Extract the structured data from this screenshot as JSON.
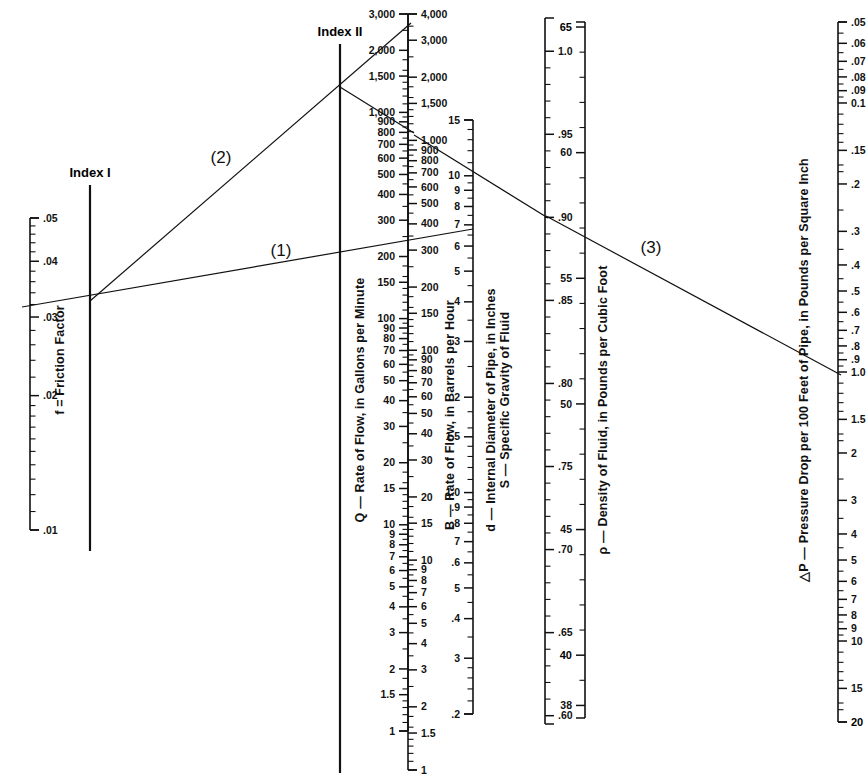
{
  "figure": {
    "type": "nomograph"
  },
  "indexes": [
    {
      "name": "index-1",
      "label": "Index I"
    },
    {
      "name": "index-2",
      "label": "Index II"
    }
  ],
  "step_labels": [
    {
      "name": "step-1",
      "label": "(1)"
    },
    {
      "name": "step-2",
      "label": "(2)"
    },
    {
      "name": "step-3",
      "label": "(3)"
    }
  ],
  "scales": [
    {
      "id": "f",
      "title": "f = Friction Factor",
      "title_side": "right",
      "tick_side": "right",
      "x": 30,
      "y_top": 218,
      "y_bottom": 530,
      "type": "log",
      "domain": [
        0.05,
        0.01
      ],
      "labeled": [
        {
          "value": 0.05,
          "text": ".05"
        },
        {
          "value": 0.04,
          "text": ".04"
        },
        {
          "value": 0.03,
          "text": ".03"
        },
        {
          "value": 0.02,
          "text": ".02"
        },
        {
          "value": 0.01,
          "text": ".01"
        }
      ],
      "minor": [
        0.048,
        0.046,
        0.044,
        0.042,
        0.038,
        0.036,
        0.034,
        0.032,
        0.028,
        0.026,
        0.024,
        0.022,
        0.019,
        0.018,
        0.017,
        0.016,
        0.015,
        0.014,
        0.013,
        0.012,
        0.011
      ]
    },
    {
      "id": "Q",
      "title": "Q — Rate of Flow, in Gallons per Minute",
      "title_side": "left",
      "tick_side": "left",
      "x": 408,
      "y_top": 14,
      "y_bottom": 731,
      "type": "log",
      "domain": [
        3000,
        1
      ],
      "labeled": [
        {
          "value": 3000,
          "text": "3,000"
        },
        {
          "value": 2000,
          "text": "2,000"
        },
        {
          "value": 1500,
          "text": "1,500"
        },
        {
          "value": 1000,
          "text": "1,000"
        },
        {
          "value": 900,
          "text": "900"
        },
        {
          "value": 800,
          "text": "800"
        },
        {
          "value": 700,
          "text": "700"
        },
        {
          "value": 600,
          "text": "600"
        },
        {
          "value": 500,
          "text": "500"
        },
        {
          "value": 400,
          "text": "400"
        },
        {
          "value": 300,
          "text": "300"
        },
        {
          "value": 200,
          "text": "200"
        },
        {
          "value": 150,
          "text": "150"
        },
        {
          "value": 100,
          "text": "100"
        },
        {
          "value": 90,
          "text": "90"
        },
        {
          "value": 80,
          "text": "80"
        },
        {
          "value": 70,
          "text": "70"
        },
        {
          "value": 60,
          "text": "60"
        },
        {
          "value": 50,
          "text": "50"
        },
        {
          "value": 40,
          "text": "40"
        },
        {
          "value": 30,
          "text": "30"
        },
        {
          "value": 20,
          "text": "20"
        },
        {
          "value": 15,
          "text": "15"
        },
        {
          "value": 10,
          "text": "10"
        },
        {
          "value": 9,
          "text": "9"
        },
        {
          "value": 8,
          "text": "8"
        },
        {
          "value": 7,
          "text": "7"
        },
        {
          "value": 6,
          "text": "6"
        },
        {
          "value": 5,
          "text": "5"
        },
        {
          "value": 4,
          "text": "4"
        },
        {
          "value": 3,
          "text": "3"
        },
        {
          "value": 2,
          "text": "2"
        },
        {
          "value": 1.5,
          "text": "1.5"
        },
        {
          "value": 1,
          "text": "1"
        }
      ],
      "minor": [
        2500,
        1800,
        1600,
        1400,
        1300,
        1200,
        1100,
        950,
        850,
        750,
        650,
        550,
        450,
        350,
        250,
        180,
        160,
        140,
        130,
        120,
        110,
        95,
        85,
        75,
        65,
        55,
        45,
        35,
        25,
        18,
        16,
        14,
        13,
        12,
        11,
        9.5,
        8.5,
        7.5,
        6.5,
        5.5,
        4.5,
        3.5,
        2.5,
        1.8,
        1.6,
        1.4,
        1.3,
        1.2,
        1.1
      ]
    },
    {
      "id": "B",
      "title": "B — Rate of Flow, in Barrels per Hour",
      "title_side": "right",
      "tick_side": "right",
      "x": 408,
      "y_top": 14,
      "y_bottom": 770,
      "type": "log",
      "domain": [
        4000,
        1
      ],
      "labeled": [
        {
          "value": 4000,
          "text": "4,000"
        },
        {
          "value": 3000,
          "text": "3,000"
        },
        {
          "value": 2000,
          "text": "2,000"
        },
        {
          "value": 1500,
          "text": "1,500"
        },
        {
          "value": 1000,
          "text": "1,000"
        },
        {
          "value": 900,
          "text": "900"
        },
        {
          "value": 800,
          "text": "800"
        },
        {
          "value": 700,
          "text": "700"
        },
        {
          "value": 600,
          "text": "600"
        },
        {
          "value": 500,
          "text": "500"
        },
        {
          "value": 400,
          "text": "400"
        },
        {
          "value": 300,
          "text": "300"
        },
        {
          "value": 200,
          "text": "200"
        },
        {
          "value": 150,
          "text": "150"
        },
        {
          "value": 100,
          "text": "100"
        },
        {
          "value": 90,
          "text": "90"
        },
        {
          "value": 80,
          "text": "80"
        },
        {
          "value": 70,
          "text": "70"
        },
        {
          "value": 60,
          "text": "60"
        },
        {
          "value": 50,
          "text": "50"
        },
        {
          "value": 40,
          "text": "40"
        },
        {
          "value": 30,
          "text": "30"
        },
        {
          "value": 20,
          "text": "20"
        },
        {
          "value": 15,
          "text": "15"
        },
        {
          "value": 10,
          "text": "10"
        },
        {
          "value": 9,
          "text": "9"
        },
        {
          "value": 8,
          "text": "8"
        },
        {
          "value": 7,
          "text": "7"
        },
        {
          "value": 6,
          "text": "6"
        },
        {
          "value": 5,
          "text": "5"
        },
        {
          "value": 4,
          "text": "4"
        },
        {
          "value": 3,
          "text": "3"
        },
        {
          "value": 2,
          "text": "2"
        },
        {
          "value": 1.5,
          "text": "1.5"
        },
        {
          "value": 1,
          "text": "1"
        }
      ],
      "minor": [
        3500,
        2500,
        1800,
        1600,
        1400,
        1300,
        1200,
        1100,
        950,
        850,
        750,
        650,
        550,
        450,
        350,
        250,
        180,
        160,
        140,
        130,
        120,
        110,
        95,
        85,
        75,
        65,
        55,
        45,
        35,
        25,
        18,
        16,
        14,
        13,
        12,
        11,
        9.5,
        8.5,
        7.5,
        6.5,
        5.5,
        4.5,
        3.5,
        2.5,
        1.8,
        1.6,
        1.4,
        1.3,
        1.2,
        1.1
      ]
    },
    {
      "id": "d",
      "title": "d — Internal Diameter of Pipe, in Inches",
      "title_side": "right",
      "tick_side": "left",
      "x": 473,
      "y_top": 120,
      "y_bottom": 714,
      "type": "log",
      "domain": [
        15,
        0.2
      ],
      "labeled": [
        {
          "value": 15,
          "text": "15"
        },
        {
          "value": 10,
          "text": "10"
        },
        {
          "value": 9,
          "text": "9"
        },
        {
          "value": 8,
          "text": "8"
        },
        {
          "value": 7,
          "text": "7"
        },
        {
          "value": 6,
          "text": "6"
        },
        {
          "value": 5,
          "text": "5"
        },
        {
          "value": 4,
          "text": "4"
        },
        {
          "value": 3,
          "text": "3"
        },
        {
          "value": 2,
          "text": "2"
        },
        {
          "value": 1.5,
          "text": "1.5"
        },
        {
          "value": 1.0,
          "text": "1.0"
        },
        {
          "value": 0.9,
          "text": ".9"
        },
        {
          "value": 0.8,
          "text": ".8"
        },
        {
          "value": 0.7,
          "text": "7"
        },
        {
          "value": 0.6,
          "text": ".6"
        },
        {
          "value": 0.5,
          "text": "5"
        },
        {
          "value": 0.4,
          "text": ".4"
        },
        {
          "value": 0.3,
          "text": "3"
        },
        {
          "value": 0.2,
          "text": ".2"
        }
      ],
      "minor": [
        14,
        13,
        12,
        11,
        9.5,
        8.5,
        7.5,
        6.5,
        5.5,
        4.5,
        3.5,
        2.5,
        1.8,
        1.6,
        1.4,
        1.3,
        1.2,
        1.1,
        0.95,
        0.85,
        0.75,
        0.65,
        0.55,
        0.45,
        0.35,
        0.28,
        0.26,
        0.24,
        0.22
      ]
    },
    {
      "id": "S",
      "title": "S — Specific Gravity of Fluid",
      "title_side": "left",
      "tick_side": "right",
      "x": 545,
      "y_top": 18,
      "y_bottom": 724,
      "type": "linear",
      "domain": [
        1.02,
        0.595
      ],
      "labeled": [
        {
          "value": 1.0,
          "text": "1.0"
        },
        {
          "value": 0.95,
          "text": ".95"
        },
        {
          "value": 0.9,
          "text": ".90"
        },
        {
          "value": 0.85,
          "text": ".85"
        },
        {
          "value": 0.8,
          "text": ".80"
        },
        {
          "value": 0.75,
          "text": ".75"
        },
        {
          "value": 0.7,
          "text": ".70"
        },
        {
          "value": 0.65,
          "text": ".65"
        },
        {
          "value": 0.6,
          "text": ".60"
        }
      ],
      "minor": [
        0.99,
        0.98,
        0.97,
        0.96,
        0.94,
        0.93,
        0.92,
        0.91,
        0.89,
        0.88,
        0.87,
        0.86,
        0.84,
        0.83,
        0.82,
        0.81,
        0.79,
        0.78,
        0.77,
        0.76,
        0.74,
        0.73,
        0.72,
        0.71,
        0.69,
        0.68,
        0.67,
        0.66,
        0.64,
        0.63,
        0.62,
        0.61
      ]
    },
    {
      "id": "rho",
      "title": "ρ — Density of Fluid, in Pounds per Cubic Foot",
      "title_side": "right",
      "tick_side": "left",
      "x": 585,
      "y_top": 22,
      "y_bottom": 718,
      "type": "linear",
      "domain": [
        65.2,
        37.5
      ],
      "labeled": [
        {
          "value": 65,
          "text": "65",
          "bold": true
        },
        {
          "value": 60,
          "text": "60"
        },
        {
          "value": 55,
          "text": "55"
        },
        {
          "value": 50,
          "text": "50"
        },
        {
          "value": 45,
          "text": "45"
        },
        {
          "value": 40,
          "text": "40",
          "bold": true
        },
        {
          "value": 38,
          "text": "38"
        }
      ],
      "minor": [
        64,
        63,
        62,
        61,
        59,
        58,
        57,
        56,
        54,
        53,
        52,
        51,
        49,
        48,
        47,
        46,
        44,
        43,
        42,
        41,
        39
      ]
    },
    {
      "id": "dP",
      "title": "△P — Pressure Drop per 100 Feet of Pipe, in Pounds per Square Inch",
      "title_side": "left",
      "tick_side": "right",
      "x": 838,
      "y_top": 22,
      "y_bottom": 722,
      "type": "log",
      "domain": [
        0.05,
        20
      ],
      "labeled": [
        {
          "value": 0.05,
          "text": ".05"
        },
        {
          "value": 0.06,
          "text": ".06"
        },
        {
          "value": 0.07,
          "text": ".07"
        },
        {
          "value": 0.08,
          "text": ".08"
        },
        {
          "value": 0.09,
          "text": ".09"
        },
        {
          "value": 0.1,
          "text": "0.1"
        },
        {
          "value": 0.15,
          "text": ".15"
        },
        {
          "value": 0.2,
          "text": ".2"
        },
        {
          "value": 0.3,
          "text": ".3"
        },
        {
          "value": 0.4,
          "text": ".4"
        },
        {
          "value": 0.5,
          "text": ".5"
        },
        {
          "value": 0.6,
          "text": ".6"
        },
        {
          "value": 0.7,
          "text": ".7"
        },
        {
          "value": 0.8,
          "text": ".8"
        },
        {
          "value": 0.9,
          "text": ".9"
        },
        {
          "value": 1.0,
          "text": "1.0"
        },
        {
          "value": 1.5,
          "text": "1.5"
        },
        {
          "value": 2,
          "text": "2"
        },
        {
          "value": 3,
          "text": "3"
        },
        {
          "value": 4,
          "text": "4"
        },
        {
          "value": 5,
          "text": "5"
        },
        {
          "value": 6,
          "text": "6"
        },
        {
          "value": 7,
          "text": "7"
        },
        {
          "value": 8,
          "text": "8"
        },
        {
          "value": 9,
          "text": "9"
        },
        {
          "value": 10,
          "text": "10"
        },
        {
          "value": 15,
          "text": "15"
        },
        {
          "value": 20,
          "text": "20",
          "bold": true
        }
      ],
      "minor": [
        0.055,
        0.065,
        0.075,
        0.085,
        0.095,
        0.11,
        0.12,
        0.13,
        0.14,
        0.17,
        0.18,
        0.25,
        0.35,
        0.45,
        0.55,
        0.65,
        0.75,
        0.85,
        0.95,
        1.1,
        1.2,
        1.3,
        1.4,
        1.7,
        1.8,
        2.5,
        3.5,
        4.5,
        5.5,
        6.5,
        7.5,
        8.5,
        9.5,
        11,
        12,
        13,
        14,
        17,
        18
      ]
    }
  ],
  "index_axes": [
    {
      "id": "index1",
      "x": 90,
      "y_top": 185,
      "y_bottom": 551
    },
    {
      "id": "index2",
      "x": 340,
      "y_top": 44,
      "y_bottom": 773
    }
  ],
  "construction_lines": [
    {
      "id": "line-1",
      "label": "(1)",
      "x1": 22,
      "y1": 307,
      "x2": 473,
      "y2": 229,
      "label_x": 281,
      "label_y": 256
    },
    {
      "id": "line-2",
      "label": "(2)",
      "x1": 90,
      "y1": 301,
      "x2": 411,
      "y2": 23,
      "label_x": 221,
      "label_y": 163
    },
    {
      "id": "line-2b",
      "label": "",
      "x1": 340,
      "y1": 87,
      "x2": 414,
      "y2": 133,
      "label_x": 0,
      "label_y": 0
    },
    {
      "id": "line-2c",
      "label": "",
      "x1": 414,
      "y1": 135,
      "x2": 548,
      "y2": 218,
      "label_x": 0,
      "label_y": 0
    },
    {
      "id": "line-3",
      "label": "(3)",
      "x1": 546,
      "y1": 216,
      "x2": 841,
      "y2": 375,
      "label_x": 651,
      "label_y": 253
    }
  ]
}
